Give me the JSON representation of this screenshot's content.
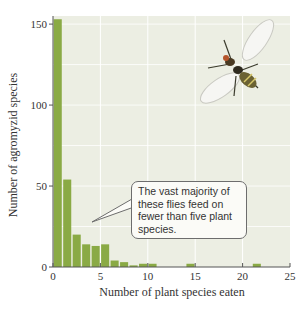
{
  "chart_data": {
    "type": "bar",
    "title": "",
    "xlabel": "Number of plant species eaten",
    "ylabel": "Number of agromyzid species",
    "xlim": [
      0,
      25
    ],
    "ylim": [
      0,
      155
    ],
    "xticks": [
      0,
      5,
      10,
      15,
      20,
      25
    ],
    "yticks": [
      0,
      50,
      100,
      150
    ],
    "grid": true,
    "x": [
      1,
      2,
      3,
      4,
      5,
      6,
      7,
      8,
      9,
      10,
      11,
      15,
      22
    ],
    "values": [
      153,
      54,
      20,
      14,
      13,
      14,
      4,
      3,
      1,
      2,
      2,
      2,
      2
    ],
    "bar_color": "#8aaa45",
    "background_color": "#eceee3",
    "annotation": "The vast majority of these flies feed on fewer than five plant species."
  },
  "callout": {
    "text": "The vast majority of these flies feed on fewer than five plant species."
  },
  "illustration": {
    "label": "fly-illustration"
  },
  "caption": "Figure"
}
